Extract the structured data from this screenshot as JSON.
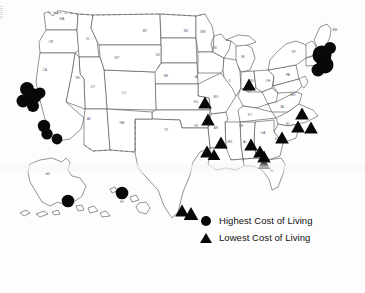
{
  "figure": {
    "kind": "thematic-map",
    "region": "United States",
    "background_color": "#fdfdfd",
    "ink_color": "#080808",
    "outline_color": "#3a3a3a"
  },
  "legend": {
    "items": [
      {
        "symbol": "circle",
        "label": "Highest Cost of Living"
      },
      {
        "symbol": "triangle",
        "label": "Lowest Cost of Living"
      }
    ]
  },
  "state_labels": [
    {
      "abbr": "WA",
      "x": 62,
      "y": 20
    },
    {
      "abbr": "OR",
      "x": 51,
      "y": 43
    },
    {
      "abbr": "ID",
      "x": 88,
      "y": 40
    },
    {
      "abbr": "MT",
      "x": 145,
      "y": 32
    },
    {
      "abbr": "ND",
      "x": 186,
      "y": 32
    },
    {
      "abbr": "MN",
      "x": 203,
      "y": 33
    },
    {
      "abbr": "SD",
      "x": 158,
      "y": 56
    },
    {
      "abbr": "WY",
      "x": 117,
      "y": 59
    },
    {
      "abbr": "NE",
      "x": 166,
      "y": 77
    },
    {
      "abbr": "IA",
      "x": 196,
      "y": 78
    },
    {
      "abbr": "WI",
      "x": 215,
      "y": 49
    },
    {
      "abbr": "MI",
      "x": 243,
      "y": 58
    },
    {
      "abbr": "CA",
      "x": 45,
      "y": 71
    },
    {
      "abbr": "NV",
      "x": 78,
      "y": 79
    },
    {
      "abbr": "UT",
      "x": 93,
      "y": 88
    },
    {
      "abbr": "CO",
      "x": 124,
      "y": 94
    },
    {
      "abbr": "KS",
      "x": 196,
      "y": 103
    },
    {
      "abbr": "MO",
      "x": 216,
      "y": 98
    },
    {
      "abbr": "IL",
      "x": 230,
      "y": 82
    },
    {
      "abbr": "IN",
      "x": 252,
      "y": 82
    },
    {
      "abbr": "OH",
      "x": 268,
      "y": 82
    },
    {
      "abbr": "PA",
      "x": 288,
      "y": 76
    },
    {
      "abbr": "NY",
      "x": 294,
      "y": 53
    },
    {
      "abbr": "ME",
      "x": 335,
      "y": 31
    },
    {
      "abbr": "AZ",
      "x": 89,
      "y": 120
    },
    {
      "abbr": "NM",
      "x": 122,
      "y": 124
    },
    {
      "abbr": "TX",
      "x": 166,
      "y": 131
    },
    {
      "abbr": "OK",
      "x": 196,
      "y": 127
    },
    {
      "abbr": "AR",
      "x": 216,
      "y": 129
    },
    {
      "abbr": "TN",
      "x": 241,
      "y": 127
    },
    {
      "abbr": "KY",
      "x": 250,
      "y": 116
    },
    {
      "abbr": "NC",
      "x": 288,
      "y": 125
    },
    {
      "abbr": "VA",
      "x": 282,
      "y": 108
    },
    {
      "abbr": "MD",
      "x": 293,
      "y": 96
    },
    {
      "abbr": "MS",
      "x": 230,
      "y": 143
    },
    {
      "abbr": "AL",
      "x": 245,
      "y": 143
    },
    {
      "abbr": "GA",
      "x": 263,
      "y": 134
    },
    {
      "abbr": "SC",
      "x": 277,
      "y": 140
    },
    {
      "abbr": "LA",
      "x": 214,
      "y": 155
    },
    {
      "abbr": "FL",
      "x": 272,
      "y": 172
    },
    {
      "abbr": "AK",
      "x": 48,
      "y": 175
    },
    {
      "abbr": "HI",
      "x": 122,
      "y": 203
    }
  ],
  "markers": {
    "highest_cost_of_living": [
      {
        "x": 27,
        "y": 89,
        "r": 7.0
      },
      {
        "x": 34,
        "y": 96,
        "r": 7.5
      },
      {
        "x": 23,
        "y": 101,
        "r": 6.5
      },
      {
        "x": 33,
        "y": 106,
        "r": 6.0
      },
      {
        "x": 40,
        "y": 93,
        "r": 5.5
      },
      {
        "x": 44,
        "y": 126,
        "r": 6.2
      },
      {
        "x": 47,
        "y": 134,
        "r": 5.6
      },
      {
        "x": 57,
        "y": 139,
        "r": 5.4
      },
      {
        "x": 68,
        "y": 201,
        "r": 6.3
      },
      {
        "x": 122,
        "y": 193,
        "r": 6.3
      },
      {
        "x": 322,
        "y": 55,
        "r": 9.5
      },
      {
        "x": 325,
        "y": 65,
        "r": 8.5
      },
      {
        "x": 318,
        "y": 70,
        "r": 6.5
      },
      {
        "x": 330,
        "y": 48,
        "r": 6.0
      }
    ],
    "lowest_cost_of_living": [
      {
        "x": 249,
        "y": 85,
        "s": 6.5
      },
      {
        "x": 205,
        "y": 103,
        "s": 6.5
      },
      {
        "x": 208,
        "y": 120,
        "s": 6.5
      },
      {
        "x": 221,
        "y": 143,
        "s": 6.5
      },
      {
        "x": 207,
        "y": 152,
        "s": 6.5
      },
      {
        "x": 214,
        "y": 155,
        "s": 6.0
      },
      {
        "x": 251,
        "y": 145,
        "s": 6.5
      },
      {
        "x": 260,
        "y": 152,
        "s": 6.5
      },
      {
        "x": 264,
        "y": 157,
        "s": 6.5
      },
      {
        "x": 264,
        "y": 164,
        "s": 6.0
      },
      {
        "x": 282,
        "y": 138,
        "s": 6.5
      },
      {
        "x": 302,
        "y": 114,
        "s": 6.5
      },
      {
        "x": 298,
        "y": 127,
        "s": 6.5
      },
      {
        "x": 311,
        "y": 128,
        "s": 6.5
      },
      {
        "x": 182,
        "y": 211,
        "s": 6.5
      },
      {
        "x": 191,
        "y": 214,
        "s": 7.0
      }
    ]
  }
}
